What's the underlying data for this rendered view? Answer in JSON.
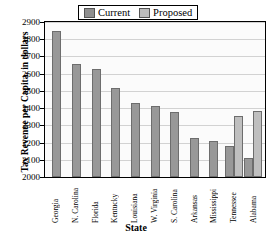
{
  "chart_data": {
    "type": "bar",
    "title": "",
    "xlabel": "State",
    "ylabel": "Tax Revenue per Capita, in dollars",
    "ylim": [
      2000,
      2900
    ],
    "ytick_step": 100,
    "yticks": [
      "2900",
      "2800",
      "2700",
      "2600",
      "2500",
      "2400",
      "2300",
      "2200",
      "2100",
      "2000"
    ],
    "grid": true,
    "legend_position": "top",
    "categories": [
      "Georgia",
      "N. Carolina",
      "Florida",
      "Kentucky",
      "Louisiana",
      "W. Virginia",
      "S. Carolina",
      "Arkansas",
      "Mississippi",
      "Tennessee",
      "Alabama"
    ],
    "series": [
      {
        "name": "Current",
        "color": "#989898",
        "values": [
          2850,
          2655,
          2625,
          2515,
          2430,
          2410,
          2380,
          2225,
          2210,
          2180,
          2110
        ]
      },
      {
        "name": "Proposed",
        "color": "#bfbfbf",
        "values": [
          null,
          null,
          null,
          null,
          null,
          null,
          null,
          null,
          null,
          2355,
          2385
        ]
      }
    ]
  },
  "legend": {
    "entries": [
      {
        "label": "Current",
        "swatch": "current-swatch"
      },
      {
        "label": "Proposed",
        "swatch": "proposed-swatch"
      }
    ]
  }
}
